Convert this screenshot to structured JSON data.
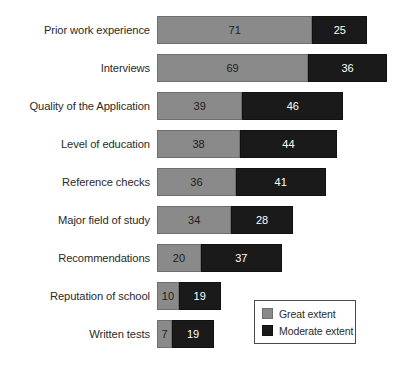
{
  "chart_data": {
    "type": "bar",
    "orientation": "horizontal",
    "stacked": true,
    "title": "",
    "xlabel": "",
    "ylabel": "",
    "grid": false,
    "axis_visible": false,
    "tick_labels": [],
    "xlim": [
      0,
      105
    ],
    "categories": [
      "Prior work experience",
      "Interviews",
      "Quality of the Application",
      "Level of education",
      "Reference checks",
      "Major field of study",
      "Recommendations",
      "Reputation of school",
      "Written tests"
    ],
    "series": [
      {
        "name": "Great extent",
        "color": "#8a8a8a",
        "values": [
          71,
          69,
          39,
          38,
          36,
          34,
          20,
          10,
          7
        ]
      },
      {
        "name": "Moderate extent",
        "color": "#1a1a1a",
        "values": [
          25,
          36,
          46,
          44,
          41,
          28,
          37,
          19,
          19
        ]
      }
    ],
    "legend": {
      "position": "bottom-right",
      "entries": [
        {
          "label": "Great extent",
          "color": "#8a8a8a",
          "swatch": "great"
        },
        {
          "label": "Moderate extent",
          "color": "#1a1a1a",
          "swatch": "moderate"
        }
      ]
    }
  },
  "layout": {
    "bar_origin_x": 157,
    "px_per_unit": 2.19,
    "bar_height": 28,
    "row_pitch": 38,
    "first_row_top": 16,
    "background": "#ffffff",
    "label_color": "#2b2b2b"
  }
}
